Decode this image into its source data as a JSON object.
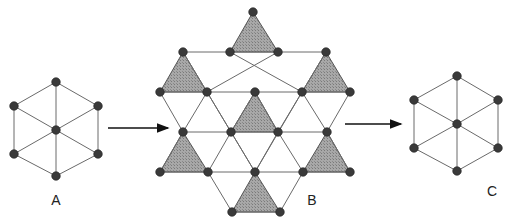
{
  "figures": [
    {
      "id": "A",
      "label": "A",
      "label_pos": [
        56,
        205
      ],
      "type": "hexagon-with-center",
      "center": [
        56,
        130
      ],
      "vertices": [
        [
          56,
          82
        ],
        [
          98,
          106
        ],
        [
          98,
          154
        ],
        [
          56,
          176
        ],
        [
          14,
          154
        ],
        [
          14,
          106
        ]
      ]
    },
    {
      "id": "B",
      "label": "B",
      "label_pos": [
        312,
        205
      ],
      "type": "kagome-lattice",
      "nodes": [
        [
          253,
          12
        ],
        [
          183,
          52
        ],
        [
          230,
          52
        ],
        [
          278,
          52
        ],
        [
          326,
          52
        ],
        [
          160,
          92
        ],
        [
          207,
          92
        ],
        [
          255,
          92
        ],
        [
          302,
          92
        ],
        [
          350,
          92
        ],
        [
          183,
          132
        ],
        [
          231,
          132
        ],
        [
          278,
          132
        ],
        [
          327,
          132
        ],
        [
          160,
          172
        ],
        [
          208,
          172
        ],
        [
          255,
          172
        ],
        [
          303,
          172
        ],
        [
          350,
          172
        ],
        [
          232,
          212
        ],
        [
          280,
          212
        ]
      ],
      "shaded_triangles": [
        [
          [
            253,
            12
          ],
          [
            230,
            52
          ],
          [
            278,
            52
          ]
        ],
        [
          [
            183,
            52
          ],
          [
            160,
            92
          ],
          [
            207,
            92
          ]
        ],
        [
          [
            326,
            52
          ],
          [
            302,
            92
          ],
          [
            350,
            92
          ]
        ],
        [
          [
            255,
            92
          ],
          [
            231,
            132
          ],
          [
            278,
            132
          ]
        ],
        [
          [
            183,
            132
          ],
          [
            160,
            172
          ],
          [
            208,
            172
          ]
        ],
        [
          [
            327,
            132
          ],
          [
            303,
            172
          ],
          [
            350,
            172
          ]
        ],
        [
          [
            255,
            172
          ],
          [
            232,
            212
          ],
          [
            280,
            212
          ]
        ]
      ],
      "edges": [
        [
          [
            183,
            52
          ],
          [
            326,
            52
          ]
        ],
        [
          [
            160,
            92
          ],
          [
            350,
            92
          ]
        ],
        [
          [
            183,
            132
          ],
          [
            327,
            132
          ]
        ],
        [
          [
            160,
            172
          ],
          [
            350,
            172
          ]
        ],
        [
          [
            232,
            212
          ],
          [
            280,
            212
          ]
        ],
        [
          [
            230,
            52
          ],
          [
            302,
            92
          ]
        ],
        [
          [
            278,
            52
          ],
          [
            207,
            92
          ]
        ],
        [
          [
            183,
            52
          ],
          [
            231,
            132
          ]
        ],
        [
          [
            326,
            52
          ],
          [
            278,
            132
          ]
        ],
        [
          [
            207,
            92
          ],
          [
            255,
            172
          ]
        ],
        [
          [
            302,
            92
          ],
          [
            255,
            172
          ]
        ],
        [
          [
            160,
            92
          ],
          [
            183,
            132
          ]
        ],
        [
          [
            350,
            92
          ],
          [
            327,
            132
          ]
        ],
        [
          [
            231,
            132
          ],
          [
            208,
            172
          ]
        ],
        [
          [
            278,
            132
          ],
          [
            303,
            172
          ]
        ],
        [
          [
            183,
            132
          ],
          [
            160,
            172
          ]
        ],
        [
          [
            327,
            132
          ],
          [
            350,
            172
          ]
        ],
        [
          [
            207,
            92
          ],
          [
            183,
            132
          ]
        ],
        [
          [
            302,
            92
          ],
          [
            327,
            132
          ]
        ],
        [
          [
            208,
            172
          ],
          [
            232,
            212
          ]
        ],
        [
          [
            303,
            172
          ],
          [
            280,
            212
          ]
        ],
        [
          [
            255,
            92
          ],
          [
            231,
            132
          ]
        ],
        [
          [
            255,
            92
          ],
          [
            278,
            132
          ]
        ],
        [
          [
            231,
            132
          ],
          [
            255,
            172
          ]
        ],
        [
          [
            278,
            132
          ],
          [
            255,
            172
          ]
        ]
      ]
    },
    {
      "id": "C",
      "label": "C",
      "label_pos": [
        492,
        196
      ],
      "type": "hexagon-with-center",
      "center": [
        457,
        124
      ],
      "vertices": [
        [
          457,
          76
        ],
        [
          498,
          100
        ],
        [
          498,
          148
        ],
        [
          457,
          171
        ],
        [
          414,
          148
        ],
        [
          414,
          100
        ]
      ]
    }
  ],
  "arrows": [
    {
      "from": [
        108,
        128
      ],
      "to": [
        168,
        128
      ]
    },
    {
      "from": [
        345,
        124
      ],
      "to": [
        401,
        124
      ]
    }
  ],
  "colors": {
    "node": "#3a3a3a",
    "edge": "#6a6a6a",
    "shade": "#9e9e9e",
    "background": "#ffffff"
  }
}
